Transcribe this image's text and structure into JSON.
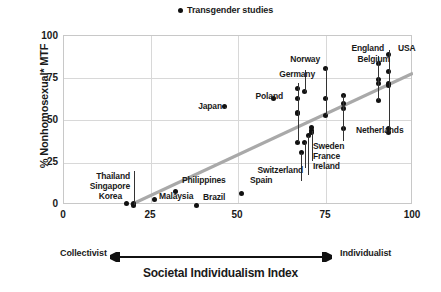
{
  "legend": {
    "marker": "filled-circle",
    "label": "Transgender studies"
  },
  "axes": {
    "ylabel": "% Nonhomosexual* MTF",
    "xlabel": "Societal Individualism Index",
    "x_left_end": "Collectivist",
    "x_right_end": "Individualist",
    "yticks": [
      "0",
      "25",
      "50",
      "75",
      "100"
    ],
    "xticks": [
      "0",
      "25",
      "50",
      "75",
      "100"
    ]
  },
  "colors": {
    "marker": "#111111",
    "trendline": "#a9a9a9",
    "grid": "#d8d8d8",
    "frame": "#c8c8c8",
    "text": "#1a1a1a"
  },
  "chart_data": {
    "type": "scatter",
    "title": "",
    "xlabel": "Societal Individualism Index",
    "ylabel": "% Nonhomosexual* MTF",
    "xlim": [
      0,
      100
    ],
    "ylim": [
      0,
      100
    ],
    "grid": true,
    "legend_position": "top-center",
    "series": [
      {
        "name": "Transgender studies",
        "points": [
          {
            "label": "Thailand",
            "x": 20,
            "y": 0
          },
          {
            "label": "Singapore",
            "x": 20,
            "y": 1
          },
          {
            "label": "Korea",
            "x": 18,
            "y": 1
          },
          {
            "label": "Malaysia",
            "x": 26,
            "y": 3
          },
          {
            "label": "Philippines",
            "x": 32,
            "y": 8
          },
          {
            "label": "Brazil",
            "x": 38,
            "y": 0
          },
          {
            "label": "Japan",
            "x": 46,
            "y": 58
          },
          {
            "label": "Spain",
            "x": 51,
            "y": 7
          },
          {
            "label": "Poland",
            "x": 60,
            "y": 63
          },
          {
            "label": "Switzerland",
            "x": 68,
            "y": 31
          },
          {
            "label": "Germany",
            "x": 67,
            "y": 69
          },
          {
            "label": "Germany",
            "x": 67,
            "y": 63
          },
          {
            "label": "Germany",
            "x": 67,
            "y": 55
          },
          {
            "label": "Germany",
            "x": 67,
            "y": 54
          },
          {
            "label": "Germany",
            "x": 67,
            "y": 37
          },
          {
            "label": "Norway",
            "x": 69,
            "y": 67
          },
          {
            "label": "Sweden",
            "x": 69,
            "y": 37
          },
          {
            "label": "France",
            "x": 71,
            "y": 46
          },
          {
            "label": "France",
            "x": 71,
            "y": 44
          },
          {
            "label": "France",
            "x": 71,
            "y": 43
          },
          {
            "label": "Ireland",
            "x": 70,
            "y": 41
          },
          {
            "label": "Denmark",
            "x": 75,
            "y": 81
          },
          {
            "label": "Denmark",
            "x": 75,
            "y": 63
          },
          {
            "label": "Denmark",
            "x": 75,
            "y": 53
          },
          {
            "label": "Belgium",
            "x": 80,
            "y": 65
          },
          {
            "label": "Belgium",
            "x": 80,
            "y": 60
          },
          {
            "label": "Belgium",
            "x": 80,
            "y": 57
          },
          {
            "label": "Netherlands",
            "x": 80,
            "y": 45
          },
          {
            "label": "England",
            "x": 90,
            "y": 84
          },
          {
            "label": "England",
            "x": 90,
            "y": 74
          },
          {
            "label": "England",
            "x": 90,
            "y": 72
          },
          {
            "label": "England",
            "x": 90,
            "y": 62
          },
          {
            "label": "USA",
            "x": 93,
            "y": 89
          },
          {
            "label": "USA",
            "x": 93,
            "y": 79
          },
          {
            "label": "USA",
            "x": 93,
            "y": 72
          },
          {
            "label": "USA",
            "x": 93,
            "y": 71
          },
          {
            "label": "USA",
            "x": 93,
            "y": 45
          },
          {
            "label": "USA",
            "x": 93,
            "y": 43
          }
        ]
      }
    ],
    "trendline": {
      "x0": 19,
      "y0": 0,
      "x1": 100,
      "y1": 78,
      "color": "#a9a9a9"
    },
    "annotations": [
      {
        "text": "Thailand",
        "anchor_x": 20,
        "anchor_y": 0
      },
      {
        "text": "Singapore",
        "anchor_x": 20,
        "anchor_y": 1
      },
      {
        "text": "Korea",
        "anchor_x": 18,
        "anchor_y": 1
      },
      {
        "text": "Malaysia",
        "anchor_x": 26,
        "anchor_y": 3
      },
      {
        "text": "Philippines",
        "anchor_x": 32,
        "anchor_y": 8
      },
      {
        "text": "Brazil",
        "anchor_x": 38,
        "anchor_y": 0
      },
      {
        "text": "Japan",
        "anchor_x": 46,
        "anchor_y": 58
      },
      {
        "text": "Spain",
        "anchor_x": 51,
        "anchor_y": 7
      },
      {
        "text": "Poland",
        "anchor_x": 60,
        "anchor_y": 63
      },
      {
        "text": "Germany",
        "anchor_x": 67,
        "anchor_y": 69
      },
      {
        "text": "Norway",
        "anchor_x": 69,
        "anchor_y": 67
      },
      {
        "text": "Switzerland",
        "anchor_x": 68,
        "anchor_y": 31
      },
      {
        "text": "Sweden",
        "anchor_x": 69,
        "anchor_y": 37
      },
      {
        "text": "France",
        "anchor_x": 71,
        "anchor_y": 44
      },
      {
        "text": "Ireland",
        "anchor_x": 70,
        "anchor_y": 41
      },
      {
        "text": "Belgium",
        "anchor_x": 80,
        "anchor_y": 65
      },
      {
        "text": "Netherlands",
        "anchor_x": 80,
        "anchor_y": 45
      },
      {
        "text": "England",
        "anchor_x": 90,
        "anchor_y": 84
      },
      {
        "text": "USA",
        "anchor_x": 93,
        "anchor_y": 89
      }
    ]
  },
  "labels": {
    "thailand": "Thailand",
    "singapore": "Singapore",
    "korea": "Korea",
    "malaysia": "Malaysia",
    "philippines": "Philippines",
    "brazil": "Brazil",
    "japan": "Japan",
    "spain": "Spain",
    "poland": "Poland",
    "germany": "Germany",
    "norway": "Norway",
    "switzerland": "Switzerland",
    "sweden": "Sweden",
    "france": "France",
    "ireland": "Ireland",
    "belgium": "Belgium",
    "netherlands": "Netherlands",
    "england": "England",
    "usa": "USA"
  }
}
